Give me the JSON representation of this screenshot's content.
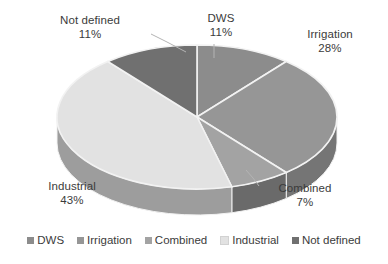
{
  "chart_data": {
    "type": "pie",
    "title": "",
    "subtitle": "",
    "xlabel": "",
    "ylabel": "",
    "categories": [
      "DWS",
      "Irrigation",
      "Combined",
      "Industrial",
      "Not defined"
    ],
    "values": [
      11,
      28,
      7,
      43,
      11
    ],
    "value_unit": "%",
    "total": 100,
    "three_d": true,
    "start_angle_deg": 0,
    "direction": "clockwise",
    "grid": false,
    "legend_position": "bottom",
    "legend_orientation": "horizontal",
    "slices": [
      {
        "label": "DWS",
        "value": 11,
        "display_value": "11%",
        "color": "#8c8c8c",
        "side_color": "#6e6e6e",
        "label_text": "DWS",
        "label_pct": "11%",
        "has_leader_line": true
      },
      {
        "label": "Irrigation",
        "value": 28,
        "display_value": "28%",
        "color": "#969696",
        "side_color": "#757575",
        "label_text": "Irrigation",
        "label_pct": "28%",
        "has_leader_line": false
      },
      {
        "label": "Combined",
        "value": 7,
        "display_value": "7%",
        "color": "#a3a3a3",
        "side_color": "#6a6a6a",
        "label_text": "Combined",
        "label_pct": "7%",
        "has_leader_line": true
      },
      {
        "label": "Industrial",
        "value": 43,
        "display_value": "43%",
        "color": "#e2e2e2",
        "side_color": "#9d9d9d",
        "label_text": "Industrial",
        "label_pct": "43%",
        "has_leader_line": false
      },
      {
        "label": "Not defined",
        "value": 11,
        "display_value": "11%",
        "color": "#707070",
        "side_color": "#565656",
        "label_text": "Not defined",
        "label_pct": "11%",
        "has_leader_line": true
      }
    ]
  },
  "labels": {
    "dws": {
      "name": "DWS",
      "pct": "11%"
    },
    "irrigation": {
      "name": "Irrigation",
      "pct": "28%"
    },
    "combined": {
      "name": "Combined",
      "pct": "7%"
    },
    "industrial": {
      "name": "Industrial",
      "pct": "43%"
    },
    "notdefined": {
      "name": "Not defined",
      "pct": "11%"
    }
  },
  "legend": {
    "items": [
      {
        "label": "DWS",
        "color": "#8c8c8c"
      },
      {
        "label": "Irrigation",
        "color": "#969696"
      },
      {
        "label": "Combined",
        "color": "#a3a3a3"
      },
      {
        "label": "Industrial",
        "color": "#e2e2e2"
      },
      {
        "label": "Not defined",
        "color": "#707070"
      }
    ]
  },
  "colors": {
    "background": "#ffffff",
    "text": "#3b3b3b",
    "slice_separator": "#f2f2f2",
    "leader_line": "#b4b4b4"
  }
}
